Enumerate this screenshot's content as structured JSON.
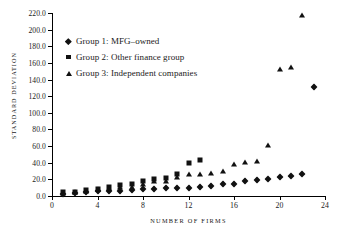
{
  "chart_data": {
    "type": "scatter",
    "title": "",
    "xlabel": "NUMBER OF FIRMS",
    "ylabel": "STANDARD DEVIATION",
    "xlim": [
      0,
      24
    ],
    "ylim": [
      0,
      220
    ],
    "xticks": [
      "0",
      "4",
      "8",
      "12",
      "16",
      "20",
      "24"
    ],
    "xtick_values": [
      0,
      4,
      8,
      12,
      16,
      20,
      24
    ],
    "yticks": [
      "0.0",
      "20.0",
      "40.0",
      "60.0",
      "80.0",
      "100.0",
      "120.0",
      "140.0",
      "160.0",
      "180.0",
      "200.0",
      "220.0"
    ],
    "ytick_values": [
      0,
      20,
      40,
      60,
      80,
      100,
      120,
      140,
      160,
      180,
      200,
      220
    ],
    "grid": false,
    "legend_position": "upper-left",
    "series": [
      {
        "name": "Group 1: MFG–owned",
        "marker": "diamond",
        "color": "#111111",
        "points": [
          [
            1,
            3.0
          ],
          [
            2,
            4.0
          ],
          [
            3,
            5.0
          ],
          [
            4,
            6.0
          ],
          [
            5,
            6.5
          ],
          [
            6,
            6.5
          ],
          [
            7,
            7.0
          ],
          [
            8,
            8.5
          ],
          [
            9,
            9.0
          ],
          [
            10,
            9.5
          ],
          [
            11,
            9.5
          ],
          [
            12,
            10.0
          ],
          [
            13,
            10.5
          ],
          [
            14,
            12.0
          ],
          [
            15,
            14.5
          ],
          [
            16,
            14.5
          ],
          [
            17,
            18.0
          ],
          [
            18,
            19.0
          ],
          [
            19,
            21.0
          ],
          [
            20,
            23.0
          ],
          [
            21,
            24.5
          ],
          [
            22,
            27.0
          ],
          [
            23,
            131.0
          ]
        ]
      },
      {
        "name": "Group 2: Other finance group",
        "marker": "square",
        "color": "#111111",
        "points": [
          [
            1,
            5.0
          ],
          [
            2,
            5.0
          ],
          [
            3,
            7.0
          ],
          [
            4,
            8.0
          ],
          [
            5,
            11.0
          ],
          [
            6,
            13.0
          ],
          [
            7,
            14.0
          ],
          [
            8,
            18.0
          ],
          [
            9,
            21.0
          ],
          [
            10,
            22.0
          ],
          [
            11,
            26.0
          ],
          [
            12,
            40.0
          ],
          [
            13,
            43.0
          ]
        ]
      },
      {
        "name": "Group 3: Independent companies",
        "marker": "triangle",
        "color": "#111111",
        "points": [
          [
            1,
            4.0
          ],
          [
            2,
            5.0
          ],
          [
            3,
            6.5
          ],
          [
            4,
            8.0
          ],
          [
            5,
            9.5
          ],
          [
            6,
            10.5
          ],
          [
            7,
            11.0
          ],
          [
            8,
            14.0
          ],
          [
            9,
            18.0
          ],
          [
            10,
            18.0
          ],
          [
            11,
            23.0
          ],
          [
            12,
            26.0
          ],
          [
            13,
            26.0
          ],
          [
            14,
            28.0
          ],
          [
            15,
            30.0
          ],
          [
            16,
            39.0
          ],
          [
            17,
            41.0
          ],
          [
            18,
            42.0
          ],
          [
            19,
            61.0
          ],
          [
            20,
            153.0
          ],
          [
            21,
            154.5
          ],
          [
            22,
            217.0
          ]
        ]
      }
    ]
  }
}
